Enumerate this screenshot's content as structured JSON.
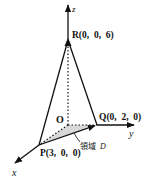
{
  "diagram": {
    "type": "3d-coordinate-tetrahedron",
    "axes": {
      "x": {
        "label": "x"
      },
      "y": {
        "label": "y"
      },
      "z": {
        "label": "z"
      }
    },
    "points": {
      "origin": {
        "label": "O"
      },
      "P": {
        "label": "P(3,  0,  0)",
        "coords": [
          3,
          0,
          0
        ]
      },
      "Q": {
        "label": "Q(0,  2,  0)",
        "coords": [
          0,
          2,
          0
        ]
      },
      "R": {
        "label": "R(0,  0,  6)",
        "coords": [
          0,
          0,
          6
        ]
      }
    },
    "region": {
      "label_prefix": "領域",
      "label_var": "D",
      "fill": "#d8d8d8"
    },
    "colors": {
      "line": "#111111",
      "background": "#ffffff"
    }
  }
}
